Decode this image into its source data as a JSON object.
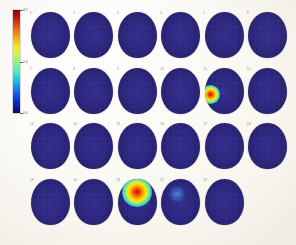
{
  "figure": {
    "modality_label": "functional activation montage",
    "background_color": "#fdfbf7"
  },
  "colorbar": {
    "name": "activation-intensity-colorbar",
    "colormap": "jet",
    "orientation": "vertical",
    "high_color": "#800000",
    "low_color": "#000060",
    "ticks": [
      {
        "label": "4.7",
        "position_pct": 0
      },
      {
        "label": "2.4",
        "position_pct": 50
      },
      {
        "label": "0.0",
        "position_pct": 100
      }
    ]
  },
  "montage": {
    "rows": 4,
    "columns": 6,
    "total_slices": 23,
    "rows_data": [
      {
        "row_index": 1,
        "slices": [
          {
            "index": "1",
            "activation": "none"
          },
          {
            "index": "2",
            "activation": "none"
          },
          {
            "index": "3",
            "activation": "none"
          },
          {
            "index": "4",
            "activation": "none"
          },
          {
            "index": "5",
            "activation": "none"
          },
          {
            "index": "6",
            "activation": "none"
          }
        ]
      },
      {
        "row_index": 2,
        "slices": [
          {
            "index": "7",
            "activation": "none"
          },
          {
            "index": "8",
            "activation": "none"
          },
          {
            "index": "9",
            "activation": "none"
          },
          {
            "index": "10",
            "activation": "none"
          },
          {
            "index": "11",
            "activation": "strong",
            "spot_x_pct": 16,
            "spot_y_pct": 58,
            "spot_size": 19
          },
          {
            "index": "12",
            "activation": "none"
          }
        ]
      },
      {
        "row_index": 3,
        "slices": [
          {
            "index": "13",
            "activation": "none"
          },
          {
            "index": "14",
            "activation": "none"
          },
          {
            "index": "15",
            "activation": "none"
          },
          {
            "index": "16",
            "activation": "none"
          },
          {
            "index": "17",
            "activation": "none"
          },
          {
            "index": "18",
            "activation": "none"
          }
        ]
      },
      {
        "row_index": 4,
        "slices": [
          {
            "index": "19",
            "activation": "none"
          },
          {
            "index": "20",
            "activation": "none"
          },
          {
            "index": "21",
            "activation": "strong",
            "spot_x_pct": 50,
            "spot_y_pct": 30,
            "spot_size": 30
          },
          {
            "index": "22",
            "activation": "faint",
            "spot_x_pct": 40,
            "spot_y_pct": 34,
            "spot_size": 16
          },
          {
            "index": "23",
            "activation": "none"
          }
        ]
      }
    ]
  },
  "ghost_caption": "······ ·· ······· ·········· ·· ···· ···· ······"
}
